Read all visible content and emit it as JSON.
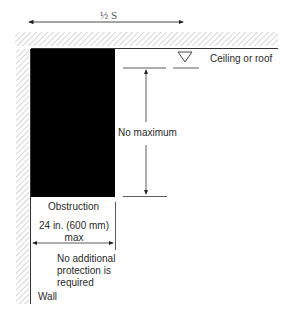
{
  "diagram": {
    "top_dimension": {
      "label": "½ S"
    },
    "ceiling": {
      "label": "Ceiling or roof"
    },
    "vertical_dimension": {
      "label": "No maximum"
    },
    "obstruction": {
      "label": "Obstruction"
    },
    "width_dimension": {
      "line1": "24 in. (600 mm)",
      "line2": "max"
    },
    "note": {
      "line1": "No additional",
      "line2": "protection is",
      "line3": "required"
    },
    "wall": {
      "label": "Wall"
    },
    "colors": {
      "line": "#333333",
      "hatch": "#bdbdbd",
      "obstruction": "#000000"
    }
  }
}
